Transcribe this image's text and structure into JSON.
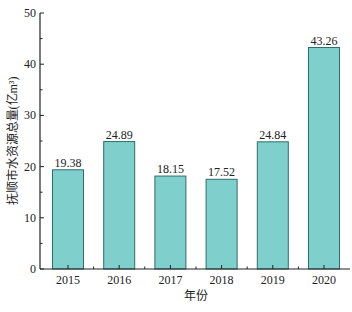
{
  "chart_data": {
    "type": "bar",
    "title": "",
    "xlabel": "年份",
    "ylabel": "抚顺市水资源总量(亿m³)",
    "categories": [
      "2015",
      "2016",
      "2017",
      "2018",
      "2019",
      "2020"
    ],
    "values": [
      19.38,
      24.89,
      18.15,
      17.52,
      24.84,
      43.26
    ],
    "value_labels": [
      "19.38",
      "24.89",
      "18.15",
      "17.52",
      "24.84",
      "43.26"
    ],
    "ylim": [
      0,
      50
    ],
    "yticks": [
      0,
      10,
      20,
      30,
      40,
      50
    ],
    "grid": false,
    "legend": null,
    "bar_color": "#7fcfcc",
    "bar_edge_color": "#2e6e6a"
  }
}
